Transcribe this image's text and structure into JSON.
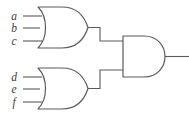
{
  "diagram": {
    "stroke_color": "#5a5a5a",
    "fill_color": "#ffffff",
    "label_color": "#3a3a3a",
    "background": "#ffffff"
  },
  "inputs": [
    {
      "id": "a",
      "label": "a",
      "gate": "or-gate-1",
      "pin": 1,
      "x": 14,
      "y": 16
    },
    {
      "id": "b",
      "label": "b",
      "gate": "or-gate-1",
      "pin": 2,
      "x": 14,
      "y": 28
    },
    {
      "id": "c",
      "label": "c",
      "gate": "or-gate-1",
      "pin": 3,
      "x": 14,
      "y": 41
    },
    {
      "id": "d",
      "label": "d",
      "gate": "or-gate-2",
      "pin": 1,
      "x": 14,
      "y": 77
    },
    {
      "id": "e",
      "label": "e",
      "gate": "or-gate-2",
      "pin": 2,
      "x": 14,
      "y": 89
    },
    {
      "id": "f",
      "label": "f",
      "gate": "or-gate-2",
      "pin": 3,
      "x": 14,
      "y": 102
    }
  ],
  "gates": [
    {
      "id": "or-gate-1",
      "type": "OR",
      "label": "OR",
      "inputs": [
        "a",
        "b",
        "c"
      ],
      "output": "or1-out"
    },
    {
      "id": "or-gate-2",
      "type": "OR",
      "label": "OR",
      "inputs": [
        "d",
        "e",
        "f"
      ],
      "output": "or2-out"
    },
    {
      "id": "and-gate-1",
      "type": "AND",
      "label": "AND",
      "inputs": [
        "or1-out",
        "or2-out"
      ],
      "output": "circuit-out"
    }
  ],
  "output": {
    "id": "circuit-out",
    "label": "",
    "expression": "(a + b + c) · (d + e + f)"
  }
}
